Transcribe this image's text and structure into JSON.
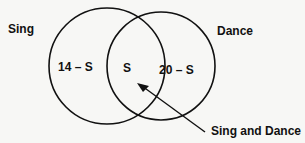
{
  "diagram": {
    "type": "venn",
    "sets": [
      {
        "label": "Sing",
        "exclusive_region": "14 – S"
      },
      {
        "label": "Dance",
        "exclusive_region": "20 – S"
      }
    ],
    "intersection": {
      "value": "S",
      "callout": "Sing and Dance"
    },
    "colors": {
      "stroke": "#111111",
      "background": "#f7f7f5"
    }
  }
}
